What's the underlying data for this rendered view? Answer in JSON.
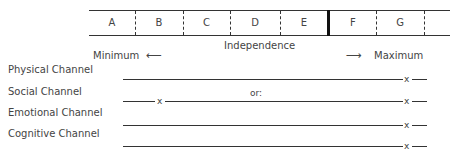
{
  "scale": {
    "cells": [
      {
        "label": "A",
        "left": 0,
        "width": 46
      },
      {
        "label": "B",
        "left": 46,
        "width": 48
      },
      {
        "label": "C",
        "left": 94,
        "width": 47
      },
      {
        "label": "D",
        "left": 141,
        "width": 50
      },
      {
        "label": "E",
        "left": 191,
        "width": 48
      },
      {
        "label": "F",
        "left": 239,
        "width": 48
      },
      {
        "label": "G",
        "left": 287,
        "width": 48
      }
    ],
    "title": "Independence",
    "min_label": "Minimum",
    "max_label": "Maximum",
    "min_arrow": "⟵",
    "max_arrow": "⟶"
  },
  "channels": [
    {
      "label": "Physical Channel",
      "x_position": "right"
    },
    {
      "label": "Social Channel",
      "x_position": "both",
      "note": "or:"
    },
    {
      "label": "Emotional Channel",
      "x_position": "right"
    },
    {
      "label": "Cognitive Channel",
      "x_position": "right"
    }
  ],
  "marker": "x"
}
